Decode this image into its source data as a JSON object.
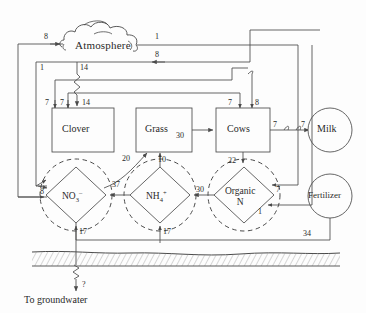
{
  "diagram": {
    "caption": "To groundwater",
    "colors": {
      "line": "#4a4a4a",
      "text": "#2a2a2a",
      "background": "#fdfdfd",
      "soil": "#8a8a8a"
    }
  },
  "nodes": {
    "atmosphere": {
      "label": "Atmosphere",
      "shape": "cloud"
    },
    "clover": {
      "label": "Clover",
      "shape": "rect"
    },
    "grass": {
      "label": "Grass",
      "shape": "rect"
    },
    "cows": {
      "label": "Cows",
      "shape": "rect"
    },
    "milk": {
      "label": "Milk",
      "shape": "circle"
    },
    "fertilizer": {
      "label": "Fertilizer",
      "shape": "circle"
    },
    "nitrate": {
      "label": "NO",
      "sub": "3",
      "sup": "–",
      "shape": "diamond-in-circle"
    },
    "ammonium": {
      "label": "NH",
      "sub": "4",
      "sup": "+",
      "shape": "diamond-in-circle"
    },
    "organic_n": {
      "label_line1": "Organic",
      "label_line2": "N",
      "shape": "diamond-in-circle"
    }
  },
  "flows": [
    {
      "id": "f-atm-in-left",
      "value": "8",
      "from": "nitrate",
      "to": "atmosphere"
    },
    {
      "id": "f-atm-out-right",
      "value": "1",
      "from": "atmosphere",
      "to": "soil-right"
    },
    {
      "id": "f-cows-atm",
      "value": "8",
      "from": "cows",
      "to": "atmosphere"
    },
    {
      "id": "f-left-rail-1",
      "value": "1",
      "from": "atmosphere",
      "to": "clover-rail"
    },
    {
      "id": "f-fix-14",
      "value": "14",
      "from": "atmosphere",
      "to": "clover"
    },
    {
      "id": "f-clover-in-14",
      "value": "14",
      "from": "atmosphere",
      "to": "clover"
    },
    {
      "id": "f-clover-7a",
      "value": "7",
      "from": "rail",
      "to": "clover"
    },
    {
      "id": "f-clover-7b",
      "value": "7",
      "from": "rail",
      "to": "clover"
    },
    {
      "id": "f-cows-7in",
      "value": "7",
      "from": "clover",
      "to": "cows"
    },
    {
      "id": "f-cows-8top",
      "value": "8",
      "from": "rail",
      "to": "cows"
    },
    {
      "id": "f-grass-cows-30",
      "value": "30",
      "from": "grass",
      "to": "cows"
    },
    {
      "id": "f-cows-milk-7a",
      "value": "7",
      "from": "cows",
      "to": "milk"
    },
    {
      "id": "f-cows-milk-7b",
      "value": "7",
      "from": "cows",
      "to": "milk"
    },
    {
      "id": "f-nitrate-grass",
      "value": "20",
      "from": "nitrate",
      "to": "grass"
    },
    {
      "id": "f-ammon-grass",
      "value": "10",
      "from": "ammonium",
      "to": "grass"
    },
    {
      "id": "f-cows-orgn-22",
      "value": "22",
      "from": "cows",
      "to": "organic_n"
    },
    {
      "id": "f-ammon-nitrate",
      "value": "37",
      "from": "ammonium",
      "to": "nitrate"
    },
    {
      "id": "f-orgn-ammon",
      "value": "30",
      "from": "organic_n",
      "to": "ammonium"
    },
    {
      "id": "f-nitrate-in-8",
      "value": "8",
      "from": "rail",
      "to": "nitrate"
    },
    {
      "id": "f-orgn-in-7",
      "value": "7",
      "from": "rail",
      "to": "organic_n"
    },
    {
      "id": "f-orgn-in-1",
      "value": "1",
      "from": "rail",
      "to": "organic_n"
    },
    {
      "id": "f-nitrate-17",
      "value": "17",
      "from": "soil",
      "to": "nitrate"
    },
    {
      "id": "f-ammon-17",
      "value": "17",
      "from": "soil",
      "to": "ammonium"
    },
    {
      "id": "f-fert-34",
      "value": "34",
      "from": "fertilizer",
      "to": "soil"
    },
    {
      "id": "f-leach",
      "value": "?",
      "from": "nitrate",
      "to": "groundwater"
    }
  ]
}
